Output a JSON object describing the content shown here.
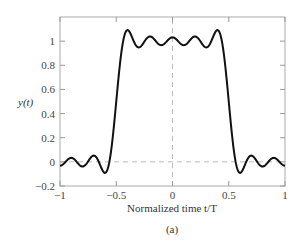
{
  "chart_data": {
    "type": "line",
    "title": "",
    "caption": "(a)",
    "xlabel": "Normalized time t/T",
    "ylabel": "y(t)",
    "xlim": [
      -1,
      1
    ],
    "ylim": [
      -0.2,
      1.2
    ],
    "xticks": [
      -1,
      -0.5,
      0,
      0.5,
      1
    ],
    "xtick_labels": [
      "−1",
      "−0.5",
      "0",
      "0.5",
      "1"
    ],
    "yticks": [
      -0.2,
      0,
      0.2,
      0.4,
      0.6,
      0.8,
      1
    ],
    "ytick_labels": [
      "−0.2",
      "0",
      "0.2",
      "0.4",
      "0.6",
      "0.8",
      "1"
    ],
    "grid": false,
    "reference_lines": [
      {
        "axis": "y",
        "value": 0,
        "style": "dashed"
      },
      {
        "axis": "x",
        "value": 0,
        "style": "dashed"
      }
    ],
    "series": [
      {
        "name": "y(t)",
        "description": "Rectangular pulse of width T (|t/T|<0.5) reconstructed with a truncated Fourier series showing Gibbs ripples",
        "x": [
          -1,
          -0.9,
          -0.8,
          -0.7,
          -0.6,
          -0.55,
          -0.5,
          -0.45,
          -0.4,
          -0.3,
          -0.2,
          -0.1,
          0,
          0.1,
          0.2,
          0.3,
          0.4,
          0.45,
          0.5,
          0.55,
          0.6,
          0.7,
          0.8,
          0.9,
          1
        ],
        "y": [
          -0.02,
          0.02,
          -0.04,
          0.04,
          -0.09,
          0.05,
          0.5,
          0.95,
          1.09,
          0.94,
          1.05,
          0.95,
          1.04,
          0.95,
          1.05,
          0.94,
          1.09,
          0.95,
          0.5,
          0.05,
          -0.09,
          0.04,
          -0.04,
          0.02,
          -0.02
        ]
      }
    ]
  }
}
